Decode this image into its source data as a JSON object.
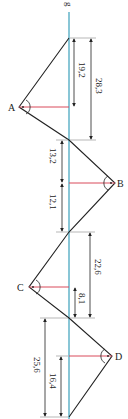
{
  "diagram": {
    "type": "survey-offset-diagram",
    "baseline": {
      "label": "g",
      "color": "#4aa8c0"
    },
    "polyline_color": "#222222",
    "perpendicular_color": "#d94a5a",
    "dimension_color": "#333333",
    "points": [
      {
        "name": "A",
        "side": "left"
      },
      {
        "name": "B",
        "side": "right"
      },
      {
        "name": "C",
        "side": "left"
      },
      {
        "name": "D",
        "side": "right"
      }
    ],
    "dimensions": [
      {
        "label": "19,2",
        "ref": "A offset foot from top"
      },
      {
        "label": "28,3",
        "ref": "top to second crossing"
      },
      {
        "label": "13,2",
        "ref": "crossing to B foot"
      },
      {
        "label": "12,1",
        "ref": "B foot to next crossing"
      },
      {
        "label": "22,6",
        "ref": "crossing to crossing"
      },
      {
        "label": "8,1",
        "ref": "C foot to crossing"
      },
      {
        "label": "25,6",
        "ref": "crossing to bottom"
      },
      {
        "label": "16,4",
        "ref": "D foot to bottom"
      }
    ]
  }
}
